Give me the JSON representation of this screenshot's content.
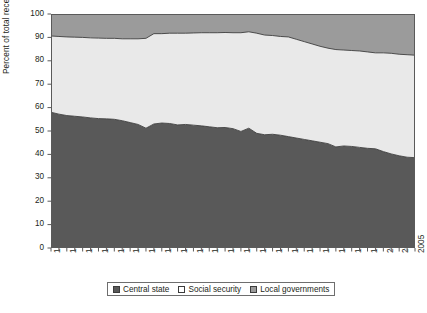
{
  "chart_data": {
    "type": "area",
    "stacked": true,
    "title": "",
    "xlabel": "",
    "ylabel": "Percent of total receipts",
    "ylim": [
      0,
      100
    ],
    "ytick_values": [
      0,
      10,
      20,
      30,
      40,
      50,
      60,
      70,
      80,
      90,
      100
    ],
    "grid": false,
    "legend_position": "bottom",
    "x": [
      1959,
      1960,
      1961,
      1962,
      1963,
      1964,
      1965,
      1966,
      1967,
      1968,
      1969,
      1970,
      1971,
      1972,
      1973,
      1974,
      1975,
      1976,
      1977,
      1978,
      1979,
      1980,
      1981,
      1982,
      1983,
      1984,
      1985,
      1986,
      1987,
      1988,
      1989,
      1990,
      1991,
      1992,
      1993,
      1994,
      1995,
      1996,
      1997,
      1998,
      1999,
      2000,
      2001,
      2002,
      2003,
      2004,
      2005
    ],
    "xtick_labels": [
      "1959",
      "1961",
      "1963",
      "1965",
      "1967",
      "1969",
      "1971",
      "1973",
      "1975",
      "1977",
      "1979",
      "1981",
      "1983",
      "1985",
      "1987",
      "1989",
      "1991",
      "1993",
      "1995",
      "1997",
      "1999",
      "2001",
      "2003",
      "2005"
    ],
    "series": [
      {
        "name": "Central state",
        "color": "#595959",
        "values": [
          58.0,
          57.2,
          56.6,
          56.3,
          56.0,
          55.6,
          55.3,
          55.2,
          55.0,
          54.4,
          53.6,
          52.8,
          51.2,
          53.0,
          53.4,
          53.2,
          52.6,
          52.8,
          52.5,
          52.2,
          51.8,
          51.4,
          51.5,
          51.0,
          49.8,
          51.2,
          49.0,
          48.4,
          48.6,
          48.2,
          47.6,
          47.0,
          46.4,
          45.8,
          45.2,
          44.6,
          43.2,
          43.6,
          43.4,
          43.0,
          42.6,
          42.4,
          41.2,
          40.2,
          39.4,
          38.8,
          38.6
        ]
      },
      {
        "name": "Social security",
        "color": "#e9e9e9",
        "values": [
          32.6,
          33.2,
          33.6,
          33.8,
          34.0,
          34.2,
          34.4,
          34.4,
          34.6,
          35.0,
          35.8,
          36.6,
          38.4,
          38.6,
          38.2,
          38.6,
          39.2,
          39.0,
          39.4,
          39.8,
          40.2,
          40.6,
          40.6,
          41.0,
          42.2,
          41.2,
          42.8,
          42.6,
          42.2,
          42.2,
          42.6,
          42.2,
          41.8,
          41.4,
          41.0,
          40.8,
          41.6,
          41.0,
          41.0,
          41.2,
          41.2,
          41.0,
          42.2,
          43.0,
          43.4,
          43.8,
          43.8
        ]
      },
      {
        "name": "Local governments",
        "color": "#9b9b9b",
        "values": [
          9.4,
          9.6,
          9.8,
          9.9,
          10.0,
          10.2,
          10.3,
          10.4,
          10.4,
          10.6,
          10.6,
          10.6,
          10.4,
          8.4,
          8.4,
          8.2,
          8.2,
          8.2,
          8.1,
          8.0,
          8.0,
          8.0,
          7.9,
          8.0,
          8.0,
          7.6,
          8.2,
          9.0,
          9.2,
          9.6,
          9.8,
          10.8,
          11.8,
          12.8,
          13.8,
          14.6,
          15.2,
          15.4,
          15.6,
          15.8,
          16.2,
          16.6,
          16.6,
          16.8,
          17.2,
          17.4,
          17.6
        ]
      }
    ],
    "boundaries_note": "Cumulative upper edges: central state line, central+social security line near 90 declining to ~82"
  },
  "legend": {
    "items": [
      {
        "label": "Central state",
        "color": "#595959"
      },
      {
        "label": "Social security",
        "color": "#f2f2f2"
      },
      {
        "label": "Local governments",
        "color": "#9b9b9b"
      }
    ]
  },
  "caption": {
    "text": ""
  }
}
